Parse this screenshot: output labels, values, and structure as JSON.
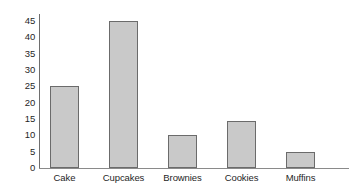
{
  "chart_data": {
    "type": "bar",
    "title": "",
    "xlabel": "",
    "ylabel": "",
    "categories": [
      "Cake",
      "Cupcakes",
      "Brownies",
      "Cookies",
      "Muffins"
    ],
    "values": [
      25,
      45,
      10,
      14.5,
      5
    ],
    "ylim": [
      0,
      45
    ],
    "yticks": [
      0,
      5,
      10,
      15,
      20,
      25,
      30,
      35,
      40,
      45
    ],
    "ytick_labels": [
      "0",
      "5",
      "10",
      "15",
      "20",
      "25",
      "30",
      "35",
      "40",
      "45"
    ],
    "grid": false,
    "legend": false,
    "bar_fill_color": "#c9c9c9",
    "bar_border_color": "#6b6b6b",
    "axis_color": "#6e6e6e",
    "background_color": "#ffffff"
  }
}
